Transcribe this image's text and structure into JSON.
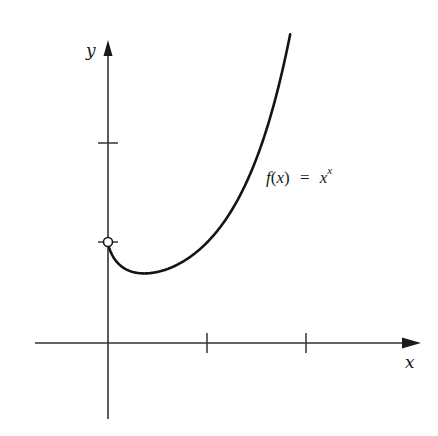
{
  "chart_data": {
    "type": "line",
    "title": "",
    "xlabel": "x",
    "ylabel": "y",
    "annotation": {
      "function_name": "f",
      "argument": "x",
      "equals": "=",
      "base": "x",
      "exponent": "x"
    },
    "series": [
      {
        "name": "f(x) = x^x",
        "x": [
          0.0,
          0.05,
          0.1,
          0.2,
          0.3,
          0.3679,
          0.5,
          0.7,
          1.0,
          1.2,
          1.4,
          1.6,
          1.84
        ],
        "y": [
          1.0,
          0.861,
          0.794,
          0.725,
          0.697,
          0.692,
          0.707,
          0.779,
          1.0,
          1.245,
          1.602,
          2.121,
          3.07
        ]
      }
    ],
    "open_point": {
      "x": 0,
      "y": 1
    },
    "minimum": {
      "x": 0.3679,
      "y": 0.692
    },
    "x_ticks": [
      1,
      2
    ],
    "y_ticks": [
      1,
      2
    ],
    "xlim": [
      -0.74,
      3.16
    ],
    "ylim": [
      -0.76,
      3.03
    ],
    "grid": false,
    "legend": false,
    "colors": {
      "stroke": "#1a1a1a",
      "background": "#ffffff"
    }
  }
}
